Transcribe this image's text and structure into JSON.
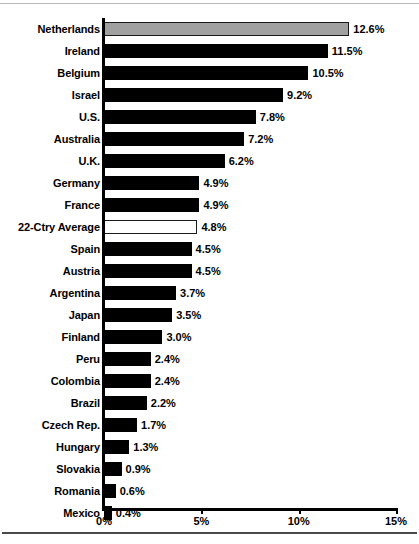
{
  "chart_data": {
    "type": "bar",
    "orientation": "horizontal",
    "title": "",
    "subtitle": "",
    "xlabel": "",
    "ylabel": "",
    "xlim": [
      0,
      15
    ],
    "grid": false,
    "legend": false,
    "value_suffix": "%",
    "xticks": [
      {
        "value": 0,
        "label": "0%"
      },
      {
        "value": 5,
        "label": "5%"
      },
      {
        "value": 10,
        "label": "10%"
      },
      {
        "value": 15,
        "label": "15%"
      }
    ],
    "colors": {
      "bar_default": "#000000",
      "bar_highlight": "#a0a0a0",
      "bar_average": "#ffffff",
      "bar_outline": "#1a1a1a",
      "axis": "#000000",
      "text": "#000000",
      "background": "#ffffff"
    },
    "categories": [
      "Netherlands",
      "Ireland",
      "Belgium",
      "Israel",
      "U.S.",
      "Australia",
      "U.K.",
      "Germany",
      "France",
      "22-Ctry Average",
      "Spain",
      "Austria",
      "Argentina",
      "Japan",
      "Finland",
      "Peru",
      "Colombia",
      "Brazil",
      "Czech Rep.",
      "Hungary",
      "Slovakia",
      "Romania",
      "Mexico"
    ],
    "values": [
      12.6,
      11.5,
      10.5,
      9.2,
      7.8,
      7.2,
      6.2,
      4.9,
      4.9,
      4.8,
      4.5,
      4.5,
      3.7,
      3.5,
      3.0,
      2.4,
      2.4,
      2.2,
      1.7,
      1.3,
      0.9,
      0.6,
      0.4
    ],
    "data_labels": [
      "12.6%",
      "11.5%",
      "10.5%",
      "9.2%",
      "7.8%",
      "7.2%",
      "6.2%",
      "4.9%",
      "4.9%",
      "4.8%",
      "4.5%",
      "4.5%",
      "3.7%",
      "3.5%",
      "3.0%",
      "2.4%",
      "2.4%",
      "2.2%",
      "1.7%",
      "1.3%",
      "0.9%",
      "0.6%",
      "0.4%"
    ],
    "bars": [
      {
        "label": "Netherlands",
        "value": 12.6,
        "data_label": "12.6%",
        "style": "gray"
      },
      {
        "label": "Ireland",
        "value": 11.5,
        "data_label": "11.5%",
        "style": "solid"
      },
      {
        "label": "Belgium",
        "value": 10.5,
        "data_label": "10.5%",
        "style": "solid"
      },
      {
        "label": "Israel",
        "value": 9.2,
        "data_label": "9.2%",
        "style": "solid"
      },
      {
        "label": "U.S.",
        "value": 7.8,
        "data_label": "7.8%",
        "style": "solid"
      },
      {
        "label": "Australia",
        "value": 7.2,
        "data_label": "7.2%",
        "style": "solid"
      },
      {
        "label": "U.K.",
        "value": 6.2,
        "data_label": "6.2%",
        "style": "solid"
      },
      {
        "label": "Germany",
        "value": 4.9,
        "data_label": "4.9%",
        "style": "solid"
      },
      {
        "label": "France",
        "value": 4.9,
        "data_label": "4.9%",
        "style": "solid"
      },
      {
        "label": "22-Ctry Average",
        "value": 4.8,
        "data_label": "4.8%",
        "style": "hollow"
      },
      {
        "label": "Spain",
        "value": 4.5,
        "data_label": "4.5%",
        "style": "solid"
      },
      {
        "label": "Austria",
        "value": 4.5,
        "data_label": "4.5%",
        "style": "solid"
      },
      {
        "label": "Argentina",
        "value": 3.7,
        "data_label": "3.7%",
        "style": "solid"
      },
      {
        "label": "Japan",
        "value": 3.5,
        "data_label": "3.5%",
        "style": "solid"
      },
      {
        "label": "Finland",
        "value": 3.0,
        "data_label": "3.0%",
        "style": "solid"
      },
      {
        "label": "Peru",
        "value": 2.4,
        "data_label": "2.4%",
        "style": "solid"
      },
      {
        "label": "Colombia",
        "value": 2.4,
        "data_label": "2.4%",
        "style": "solid"
      },
      {
        "label": "Brazil",
        "value": 2.2,
        "data_label": "2.2%",
        "style": "solid"
      },
      {
        "label": "Czech Rep.",
        "value": 1.7,
        "data_label": "1.7%",
        "style": "solid"
      },
      {
        "label": "Hungary",
        "value": 1.3,
        "data_label": "1.3%",
        "style": "solid"
      },
      {
        "label": "Slovakia",
        "value": 0.9,
        "data_label": "0.9%",
        "style": "solid"
      },
      {
        "label": "Romania",
        "value": 0.6,
        "data_label": "0.6%",
        "style": "solid"
      },
      {
        "label": "Mexico",
        "value": 0.4,
        "data_label": "0.4%",
        "style": "solid"
      }
    ]
  }
}
